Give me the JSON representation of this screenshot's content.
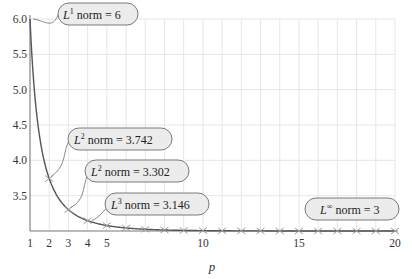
{
  "chart_data": {
    "type": "line",
    "title": "",
    "xlabel": "p",
    "ylabel": "",
    "xlim": [
      1,
      20
    ],
    "ylim": [
      3.0,
      6.0
    ],
    "grid": true,
    "x_ticks": [
      1,
      2,
      3,
      4,
      5,
      10,
      15,
      20
    ],
    "y_ticks": [
      "3.5",
      "4.0",
      "4.5",
      "5.0",
      "5.5",
      "6.0"
    ],
    "series": [
      {
        "name": "Lp norm",
        "x": [
          1,
          2,
          3,
          4,
          5,
          6,
          7,
          8,
          9,
          10,
          11,
          12,
          13,
          14,
          15,
          16,
          17,
          18,
          19,
          20
        ],
        "values": [
          6.0,
          3.742,
          3.302,
          3.146,
          3.077,
          3.043,
          3.024,
          3.014,
          3.008,
          3.005,
          3.003,
          3.002,
          3.001,
          3.001,
          3.0,
          3.0,
          3.0,
          3.0,
          3.0,
          3.0
        ]
      }
    ],
    "annotations": [
      {
        "sup": "1",
        "text": "norm = 6",
        "x": 1,
        "y": 6.0
      },
      {
        "sup": "2",
        "text": "norm = 3.742",
        "x": 2,
        "y": 3.742
      },
      {
        "sup": "2",
        "text": "norm = 3.302",
        "x": 3,
        "y": 3.302
      },
      {
        "sup": "3",
        "text": "norm = 3.146",
        "x": 4,
        "y": 3.146
      },
      {
        "sup": "∞",
        "text": "norm = 3",
        "x": 20,
        "y": 3.0
      }
    ],
    "colors": {
      "curve": "#555555",
      "marker": "#9a9a9a",
      "grid": "#e6e6e6",
      "axis": "#777777",
      "callout_fill": "#ececec",
      "callout_stroke": "#7a7a7a"
    }
  },
  "labels": {
    "x_axis": "p",
    "callouts": [
      {
        "sup": "1",
        "text": " norm = 6"
      },
      {
        "sup": "2",
        "text": " norm = 3.742"
      },
      {
        "sup": "2",
        "text": " norm = 3.302"
      },
      {
        "sup": "3",
        "text": " norm = 3.146"
      },
      {
        "sup": "∞",
        "text": " norm = 3"
      }
    ]
  }
}
